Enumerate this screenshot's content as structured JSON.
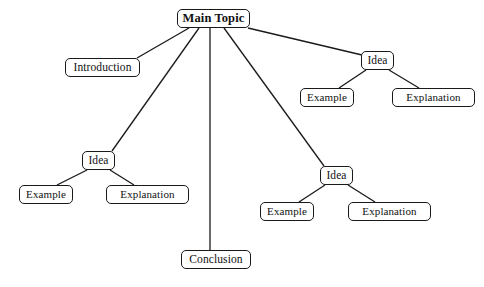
{
  "diagram": {
    "type": "mind-map",
    "background_color": "#ffffff",
    "line_color": "#1a1a1a",
    "node_border_color": "#1a1a1a",
    "node_fill_color": "#ffffff",
    "text_color": "#111111"
  },
  "nodes": {
    "root": {
      "label": "Main Topic",
      "x": 177,
      "y": 9,
      "w": 73,
      "h": 19
    },
    "introduction": {
      "label": "Introduction",
      "x": 65,
      "y": 58,
      "w": 75,
      "h": 19
    },
    "idea_right_top": {
      "label": "Idea",
      "x": 361,
      "y": 51,
      "w": 33,
      "h": 19
    },
    "example_right_top": {
      "label": "Example",
      "x": 300,
      "y": 88,
      "w": 54,
      "h": 19
    },
    "explanation_right_top": {
      "label": "Explanation",
      "x": 392,
      "y": 88,
      "w": 83,
      "h": 19
    },
    "idea_left": {
      "label": "Idea",
      "x": 82,
      "y": 151,
      "w": 33,
      "h": 19
    },
    "example_left": {
      "label": "Example",
      "x": 19,
      "y": 185,
      "w": 54,
      "h": 19
    },
    "explanation_left": {
      "label": "Explanation",
      "x": 106,
      "y": 185,
      "w": 83,
      "h": 19
    },
    "idea_right_bottom": {
      "label": "Idea",
      "x": 320,
      "y": 166,
      "w": 33,
      "h": 19
    },
    "example_right_bottom": {
      "label": "Example",
      "x": 260,
      "y": 202,
      "w": 54,
      "h": 19
    },
    "explanation_right_bottom": {
      "label": "Explanation",
      "x": 348,
      "y": 202,
      "w": 83,
      "h": 19
    },
    "conclusion": {
      "label": "Conclusion",
      "x": 181,
      "y": 250,
      "w": 70,
      "h": 19
    }
  },
  "edges": [
    {
      "from": "root",
      "to": "introduction",
      "x1": 189,
      "y1": 28,
      "x2": 137,
      "y2": 58
    },
    {
      "from": "root",
      "to": "idea_left",
      "x1": 199,
      "y1": 28,
      "x2": 112,
      "y2": 151
    },
    {
      "from": "root",
      "to": "conclusion",
      "x1": 210,
      "y1": 28,
      "x2": 210,
      "y2": 250
    },
    {
      "from": "root",
      "to": "idea_right_bottom",
      "x1": 224,
      "y1": 28,
      "x2": 324,
      "y2": 166
    },
    {
      "from": "root",
      "to": "idea_right_top",
      "x1": 248,
      "y1": 28,
      "x2": 362,
      "y2": 55
    },
    {
      "from": "idea_right_top",
      "to": "example_right_top",
      "x1": 366,
      "y1": 70,
      "x2": 339,
      "y2": 88
    },
    {
      "from": "idea_right_top",
      "to": "explanation_right_top",
      "x1": 389,
      "y1": 70,
      "x2": 419,
      "y2": 88
    },
    {
      "from": "idea_left",
      "to": "example_left",
      "x1": 87,
      "y1": 170,
      "x2": 57,
      "y2": 185
    },
    {
      "from": "idea_left",
      "to": "explanation_left",
      "x1": 110,
      "y1": 170,
      "x2": 134,
      "y2": 185
    },
    {
      "from": "idea_right_bottom",
      "to": "example_right_bottom",
      "x1": 325,
      "y1": 185,
      "x2": 299,
      "y2": 202
    },
    {
      "from": "idea_right_bottom",
      "to": "explanation_right_bottom",
      "x1": 348,
      "y1": 185,
      "x2": 375,
      "y2": 202
    }
  ]
}
